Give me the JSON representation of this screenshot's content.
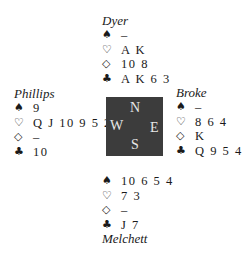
{
  "deal": {
    "north": {
      "player": "Dyer",
      "suits": [
        {
          "suit": "spades",
          "symbol": "♠",
          "cards": "–"
        },
        {
          "suit": "hearts",
          "symbol": "♡",
          "cards": "A K"
        },
        {
          "suit": "diamonds",
          "symbol": "◇",
          "cards": "10 8"
        },
        {
          "suit": "clubs",
          "symbol": "♣",
          "cards": "A K 6 3"
        }
      ]
    },
    "west": {
      "player": "Phillips",
      "suits": [
        {
          "suit": "spades",
          "symbol": "♠",
          "cards": "9"
        },
        {
          "suit": "hearts",
          "symbol": "♡",
          "cards": "Q J 10 9 5 2"
        },
        {
          "suit": "diamonds",
          "symbol": "◇",
          "cards": "–"
        },
        {
          "suit": "clubs",
          "symbol": "♣",
          "cards": "10"
        }
      ]
    },
    "east": {
      "player": "Broke",
      "suits": [
        {
          "suit": "spades",
          "symbol": "♠",
          "cards": "–"
        },
        {
          "suit": "hearts",
          "symbol": "♡",
          "cards": "8 6 4"
        },
        {
          "suit": "diamonds",
          "symbol": "◇",
          "cards": "K"
        },
        {
          "suit": "clubs",
          "symbol": "♣",
          "cards": "Q 9 5 4"
        }
      ]
    },
    "south": {
      "player": "Melchett",
      "suits": [
        {
          "suit": "spades",
          "symbol": "♠",
          "cards": "10 6 5 4"
        },
        {
          "suit": "hearts",
          "symbol": "♡",
          "cards": "7 3"
        },
        {
          "suit": "diamonds",
          "symbol": "◇",
          "cards": "–"
        },
        {
          "suit": "clubs",
          "symbol": "♣",
          "cards": "J 7"
        }
      ]
    }
  },
  "compass": {
    "n": "N",
    "s": "S",
    "e": "E",
    "w": "W",
    "background": "#3c3c3c"
  }
}
